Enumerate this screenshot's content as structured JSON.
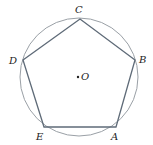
{
  "diagram": {
    "type": "regular pentagon inscribed in circle",
    "circle": {
      "cx": 79,
      "cy": 77,
      "r": 59,
      "stroke": "#9aa0a6"
    },
    "pentagon_stroke": "#5f6b78",
    "vertices": [
      {
        "id": "A",
        "label": "A",
        "x": 116,
        "y": 127,
        "lx": 111,
        "ly": 140
      },
      {
        "id": "B",
        "label": "B",
        "x": 135,
        "y": 60,
        "lx": 139,
        "ly": 63
      },
      {
        "id": "C",
        "label": "C",
        "x": 80,
        "y": 19,
        "lx": 75,
        "ly": 13
      },
      {
        "id": "D",
        "label": "D",
        "x": 23,
        "y": 60,
        "lx": 9,
        "ly": 64
      },
      {
        "id": "E",
        "label": "E",
        "x": 44,
        "y": 127,
        "lx": 36,
        "ly": 140
      }
    ],
    "center": {
      "label": "O",
      "x": 78,
      "y": 77,
      "lx": 81,
      "ly": 80
    }
  }
}
